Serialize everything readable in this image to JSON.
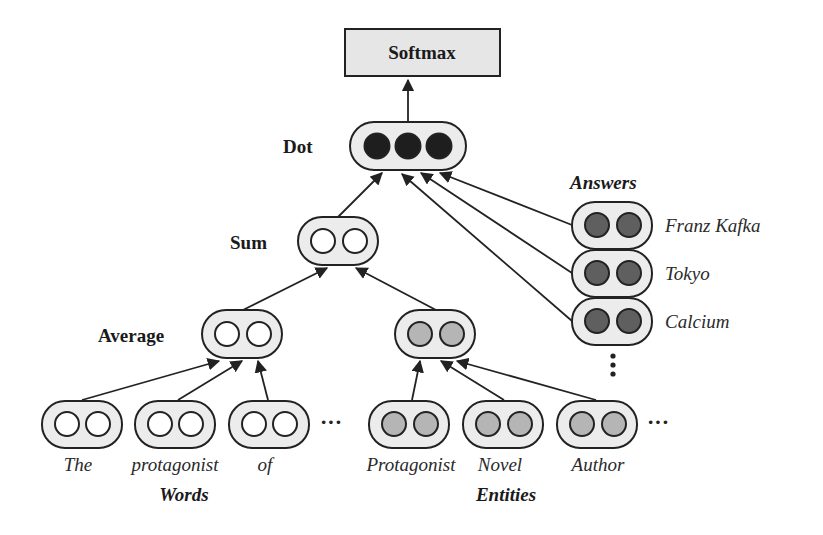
{
  "diagram": {
    "softmax": {
      "label": "Softmax"
    },
    "dot": {
      "label": "Dot",
      "circle_count": 3,
      "circle_fill": "#1e1e1e"
    },
    "sum": {
      "label": "Sum",
      "circle_fill": "#ffffff"
    },
    "average": {
      "label": "Average",
      "circle_fill": "#ffffff"
    },
    "answers": {
      "title": "Answers",
      "items": [
        {
          "label": "Franz Kafka"
        },
        {
          "label": "Tokyo"
        },
        {
          "label": "Calcium"
        }
      ],
      "ellipsis": "⋮",
      "circle_fill": "#5f5f5f"
    },
    "words": {
      "title": "Words",
      "items": [
        {
          "label": "The"
        },
        {
          "label": "protagonist"
        },
        {
          "label": "of"
        }
      ],
      "ellipsis": "···",
      "circle_fill": "#ffffff"
    },
    "entities": {
      "title": "Entities",
      "items": [
        {
          "label": "Protagonist"
        },
        {
          "label": "Novel"
        },
        {
          "label": "Author"
        }
      ],
      "ellipsis": "···",
      "circle_fill": "#b5b5b5"
    },
    "colors": {
      "pill_fill": "#ececec",
      "softmax_fill": "#e6e6e6",
      "stroke": "#222222"
    }
  }
}
